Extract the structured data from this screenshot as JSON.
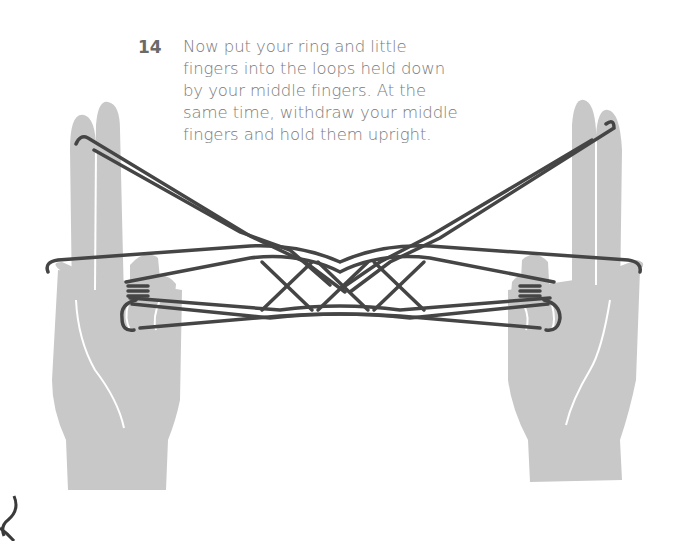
{
  "step": {
    "number": "14",
    "lines": [
      "Now put your ring and little",
      "fingers into the loops held down",
      "by your middle fingers. At the",
      "same time, withdraw your middle",
      "fingers and hold them upright."
    ]
  },
  "illustration": {
    "subject": "cat's cradle string figure held between two hands",
    "hand_color": "#c8c8c8",
    "string_color": "#454545",
    "crease_color": "#ffffff",
    "text_color": "#7a7a7a"
  }
}
